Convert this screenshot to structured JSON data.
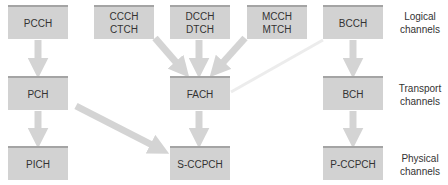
{
  "colors": {
    "box_fill": "#d2d2d2",
    "box_top_edge": "#a4a4a4",
    "arrow_fill": "#d4d4d4",
    "faint_line": "#ececec",
    "text": "#333333"
  },
  "rows": {
    "logical": {
      "label_line1": "Logical",
      "label_line2": "channels"
    },
    "transport": {
      "label_line1": "Transport",
      "label_line2": "channels"
    },
    "physical": {
      "label_line1": "Physical",
      "label_line2": "channels"
    }
  },
  "logical_channels": [
    {
      "id": "pcch",
      "line1": "PCCH",
      "line2": ""
    },
    {
      "id": "ccch-ctch",
      "line1": "CCCH",
      "line2": "CTCH"
    },
    {
      "id": "dcch-dtch",
      "line1": "DCCH",
      "line2": "DTCH"
    },
    {
      "id": "mcch-mtch",
      "line1": "MCCH",
      "line2": "MTCH"
    },
    {
      "id": "bcch",
      "line1": "BCCH",
      "line2": ""
    }
  ],
  "transport_channels": [
    {
      "id": "pch",
      "line1": "PCH"
    },
    {
      "id": "fach",
      "line1": "FACH"
    },
    {
      "id": "bch",
      "line1": "BCH"
    }
  ],
  "physical_channels": [
    {
      "id": "pich",
      "line1": "PICH"
    },
    {
      "id": "s-ccpch",
      "line1": "S-CCPCH"
    },
    {
      "id": "p-ccpch",
      "line1": "P-CCPCH"
    }
  ],
  "mappings": [
    {
      "from": "PCCH",
      "to": "PCH"
    },
    {
      "from": "CCCH/CTCH",
      "to": "FACH"
    },
    {
      "from": "DCCH/DTCH",
      "to": "FACH"
    },
    {
      "from": "MCCH/MTCH",
      "to": "FACH"
    },
    {
      "from": "BCCH",
      "to": "FACH",
      "style": "faint"
    },
    {
      "from": "BCCH",
      "to": "BCH"
    },
    {
      "from": "PCH",
      "to": "PICH"
    },
    {
      "from": "PCH",
      "to": "S-CCPCH"
    },
    {
      "from": "FACH",
      "to": "S-CCPCH"
    },
    {
      "from": "BCH",
      "to": "P-CCPCH"
    }
  ]
}
